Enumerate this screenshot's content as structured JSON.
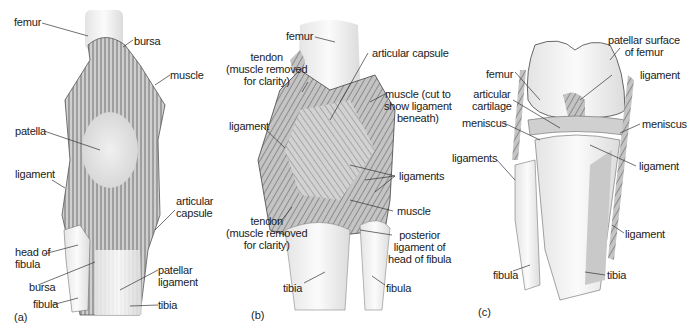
{
  "figure": {
    "panels": [
      {
        "tag": "(a)",
        "labels": {
          "femur": "femur",
          "bursa_top": "bursa",
          "muscle": "muscle",
          "patella": "patella",
          "ligament": "ligament",
          "articular_capsule": "articular\ncapsule",
          "head_of_fibula": "head of\nfibula",
          "bursa_bottom": "bursa",
          "patellar_ligament": "patellar\nligament",
          "fibula": "fibula",
          "tibia": "tibia"
        }
      },
      {
        "tag": "(b)",
        "labels": {
          "femur": "femur",
          "tendon_top": "tendon\n(muscle removed\nfor clarity)",
          "articular_capsule": "articular capsule",
          "muscle_cut": "muscle (cut to\nshow ligament\nbeneath)",
          "ligament": "ligament",
          "ligaments": "ligaments",
          "muscle": "muscle",
          "tendon_bottom": "tendon\n(muscle removed\nfor clarity)",
          "posterior_ligament": "posterior\nligament of\nhead of fibula",
          "tibia": "tibia",
          "fibula": "fibula"
        }
      },
      {
        "tag": "(c)",
        "labels": {
          "patellar_surface": "patellar surface\nof femur",
          "femur": "femur",
          "ligament_top": "ligament",
          "articular_cartilage": "articular\ncartilage",
          "meniscus_left": "meniscus",
          "meniscus_right": "meniscus",
          "ligaments": "ligaments",
          "ligament_mid": "ligament",
          "ligament_lower": "ligament",
          "fibula": "fibula",
          "tibia": "tibia"
        }
      }
    ]
  }
}
